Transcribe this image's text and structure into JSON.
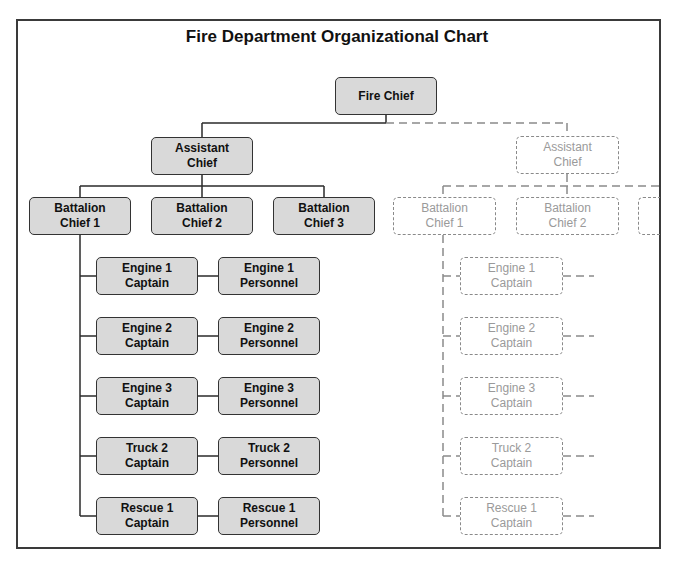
{
  "title": "Fire Department Organizational Chart",
  "colors": {
    "box_fill": "#d9d9d9",
    "box_border": "#333333",
    "ghost_border": "#8a8a8a",
    "ghost_text": "#9a9a9a",
    "frame": "#3a3a3a"
  },
  "solid": {
    "fire_chief": "Fire Chief",
    "assistant_chief": "Assistant\nChief",
    "battalion_chiefs": [
      "Battalion\nChief 1",
      "Battalion\nChief 2",
      "Battalion\nChief 3"
    ],
    "units": [
      {
        "captain": "Engine 1\nCaptain",
        "personnel": "Engine 1\nPersonnel"
      },
      {
        "captain": "Engine 2\nCaptain",
        "personnel": "Engine 2\nPersonnel"
      },
      {
        "captain": "Engine 3\nCaptain",
        "personnel": "Engine 3\nPersonnel"
      },
      {
        "captain": "Truck 2\nCaptain",
        "personnel": "Truck 2\nPersonnel"
      },
      {
        "captain": "Rescue 1\nCaptain",
        "personnel": "Rescue 1\nPersonnel"
      }
    ]
  },
  "ghost": {
    "assistant_chief": "Assistant\nChief",
    "battalion_chiefs": [
      "Battalion\nChief 1",
      "Battalion\nChief 2",
      ""
    ],
    "captains": [
      "Engine 1\nCaptain",
      "Engine 2\nCaptain",
      "Engine 3\nCaptain",
      "Truck 2\nCaptain",
      "Rescue 1\nCaptain"
    ]
  }
}
